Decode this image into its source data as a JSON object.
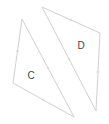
{
  "diagram": {
    "width": 109,
    "height": 124,
    "background": "#ffffff",
    "stroke_color": "#d0d0d0",
    "label_color": "#444444",
    "shapes": [
      {
        "id": "C",
        "label": "C",
        "type": "triangle",
        "vertices": [
          [
            22,
            19
          ],
          [
            13,
            83
          ],
          [
            74,
            117
          ]
        ],
        "label_pos": [
          31,
          75
        ]
      },
      {
        "id": "D",
        "label": "D",
        "type": "triangle",
        "vertices": [
          [
            42,
            7
          ],
          [
            100,
            33
          ],
          [
            96,
            111
          ]
        ],
        "label_pos": [
          81,
          45
        ]
      }
    ]
  }
}
